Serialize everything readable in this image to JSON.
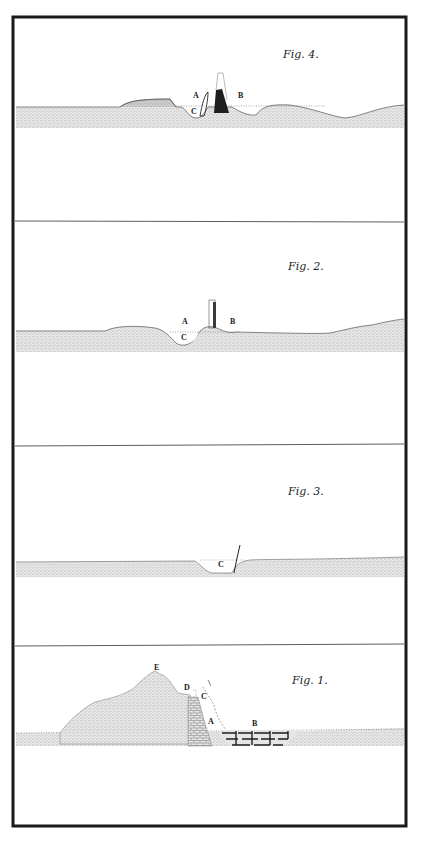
{
  "plate": {
    "frame_color": "#1a1a1a",
    "ink_color": "#222222",
    "stipple_color": "#9a9a9a",
    "panels": [
      {
        "figure": "Fig. 4.",
        "labels": [
          "A",
          "B",
          "C"
        ]
      },
      {
        "figure": "Fig. 2.",
        "labels": [
          "A",
          "B",
          "C"
        ]
      },
      {
        "figure": "Fig. 3.",
        "labels": [
          "C"
        ]
      },
      {
        "figure": "Fig. 1.",
        "labels": [
          "E",
          "D",
          "C",
          "A",
          "B"
        ]
      }
    ]
  }
}
